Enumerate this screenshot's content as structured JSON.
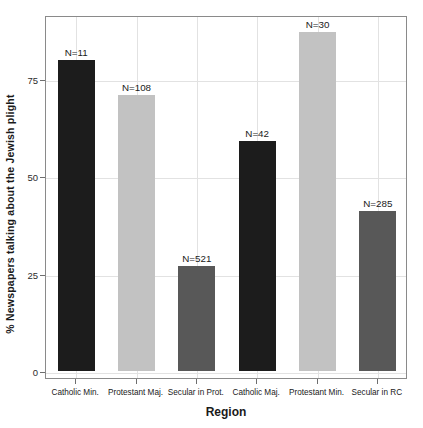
{
  "chart_data": {
    "type": "bar",
    "title": "",
    "xlabel": "Region",
    "ylabel": "% Newspapers  talking about the  Jewish plight",
    "categories": [
      "Catholic Min.",
      "Protestant Maj.",
      "Secular in Prot.",
      "Catholic Maj.",
      "Protestant Min.",
      "Secular in RC"
    ],
    "values": [
      80,
      71,
      27,
      59,
      87,
      41
    ],
    "bar_labels": [
      "N=11",
      "N=108",
      "N=521",
      "N=42",
      "N=30",
      "N=285"
    ],
    "bar_colors": [
      "#1c1c1c",
      "#c2c2c2",
      "#585858",
      "#1c1c1c",
      "#c2c2c2",
      "#585858"
    ],
    "ylim": [
      0,
      92
    ],
    "yticks": [
      0,
      25,
      50,
      75
    ],
    "ytick_labels": [
      "0",
      "25",
      "50",
      "75"
    ],
    "grid": true,
    "legend": "none"
  },
  "axis": {
    "y_title": "% Newspapers  talking about the  Jewish plight",
    "x_title": "Region"
  }
}
